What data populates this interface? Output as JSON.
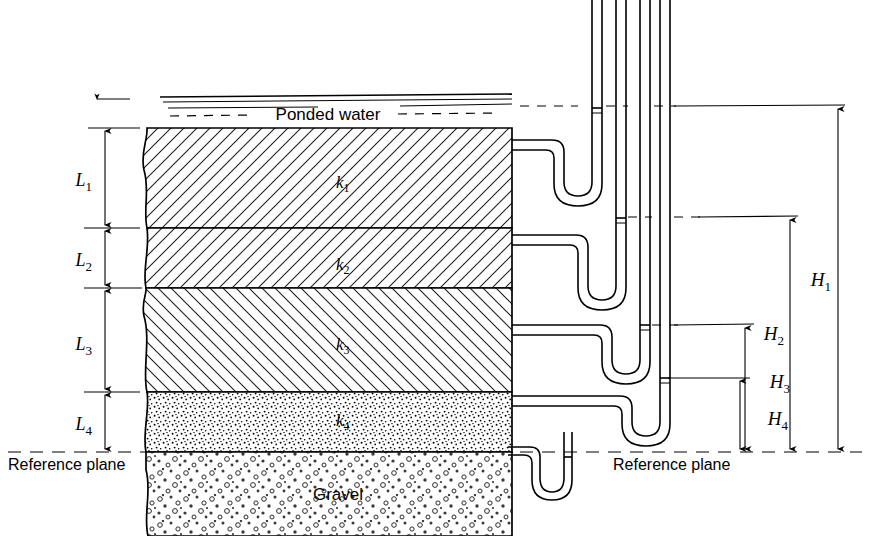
{
  "figure": {
    "colors": {
      "ink": "#000000",
      "background": "#ffffff",
      "hatch": "#1a1a1a"
    }
  },
  "labels": {
    "ponded_water": "Ponded water",
    "gravel": "Gravel",
    "reference_plane_left": "Reference plane",
    "reference_plane_right": "Reference plane"
  },
  "layers": [
    {
      "id": "layer-1",
      "perm_label": "k",
      "perm_sub": "1",
      "thickness_label": "L",
      "thickness_sub": "1",
      "fill": "hatch-right",
      "y_top": 128,
      "y_bottom": 228
    },
    {
      "id": "layer-2",
      "perm_label": "k",
      "perm_sub": "2",
      "thickness_label": "L",
      "thickness_sub": "2",
      "fill": "hatch-right",
      "y_top": 228,
      "y_bottom": 288
    },
    {
      "id": "layer-3",
      "perm_label": "k",
      "perm_sub": "3",
      "thickness_label": "L",
      "thickness_sub": "3",
      "fill": "hatch-left",
      "y_top": 288,
      "y_bottom": 392
    },
    {
      "id": "layer-4",
      "perm_label": "k",
      "perm_sub": "4",
      "thickness_label": "L",
      "thickness_sub": "4",
      "fill": "stipple-fine",
      "y_top": 392,
      "y_bottom": 452
    },
    {
      "id": "layer-gravel",
      "perm_label": "",
      "perm_sub": "",
      "thickness_label": "",
      "thickness_sub": "",
      "fill": "stipple-coarse",
      "y_top": 452,
      "y_bottom": 536
    }
  ],
  "heads": [
    {
      "id": "head-1",
      "label": "H",
      "sub": "1",
      "level_y": 106,
      "x_arrow": 838
    },
    {
      "id": "head-2",
      "label": "H",
      "sub": "2",
      "level_y": 217,
      "x_arrow": 790
    },
    {
      "id": "head-3",
      "label": "H",
      "sub": "3",
      "level_y": 325,
      "x_arrow": 745
    },
    {
      "id": "head-4",
      "label": "H",
      "sub": "4",
      "level_y": 378,
      "x_arrow": 740
    }
  ],
  "piezometers": [
    {
      "id": "piezometer-1",
      "meniscus_y": 108,
      "tube_x": 588
    },
    {
      "id": "piezometer-2",
      "meniscus_y": 218,
      "tube_x": 638
    },
    {
      "id": "piezometer-3",
      "meniscus_y": 325,
      "tube_x": 680
    },
    {
      "id": "piezometer-4",
      "meniscus_y": 378,
      "tube_x": 712
    }
  ],
  "geometry": {
    "soil_left_x": 143,
    "soil_right_x": 512,
    "water_surface_y": 99,
    "reference_plane_y": 452,
    "dimension_chain_x": 105
  }
}
